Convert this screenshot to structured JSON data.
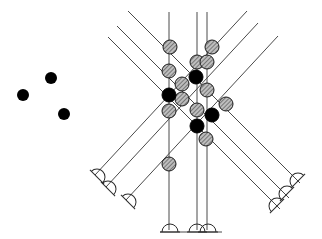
{
  "figure": {
    "canvas": {
      "width": 322,
      "height": 239,
      "background": "#ffffff"
    },
    "colors": {
      "line": "#4a4a4a",
      "node_filled": "#000000",
      "node_hatched_fill": "#b4b4b4",
      "node_stroke": "#1a1a1a",
      "support_stroke": "#2b2b2b",
      "legend_dot": "#000000"
    },
    "line_width": 1
  },
  "legend": {
    "name": "free-node-legend",
    "dots": [
      {
        "label": "node-a",
        "cx": 51,
        "cy": 78,
        "r": 6
      },
      {
        "label": "node-b",
        "cx": 23,
        "cy": 95,
        "r": 6
      },
      {
        "label": "node-c",
        "cx": 64,
        "cy": 114,
        "r": 6
      }
    ]
  },
  "structure": {
    "vertical_members": [
      {
        "name": "vertical-member-left",
        "x1": 169,
        "y1": 12,
        "x2": 169,
        "y2": 230
      },
      {
        "name": "vertical-member-center",
        "x1": 197,
        "y1": 12,
        "x2": 197,
        "y2": 230
      },
      {
        "name": "vertical-member-right",
        "x1": 207,
        "y1": 12,
        "x2": 207,
        "y2": 230
      }
    ],
    "diagonal_members_down_right": [
      {
        "name": "diagonal-dr-1",
        "x1": 128,
        "y1": 11,
        "x2": 300,
        "y2": 183
      },
      {
        "name": "diagonal-dr-2",
        "x1": 117,
        "y1": 26,
        "x2": 289,
        "y2": 198
      },
      {
        "name": "diagonal-dr-3",
        "x1": 108,
        "y1": 37,
        "x2": 280,
        "y2": 209
      }
    ],
    "diagonal_members_down_left": [
      {
        "name": "diagonal-dl-1",
        "x1": 247,
        "y1": 11,
        "x2": 95,
        "y2": 175
      },
      {
        "name": "diagonal-dl-2",
        "x1": 258,
        "y1": 23,
        "x2": 106,
        "y2": 187
      },
      {
        "name": "diagonal-dl-3",
        "x1": 278,
        "y1": 36,
        "x2": 126,
        "y2": 200
      }
    ],
    "base_line": {
      "name": "ground-base-line",
      "x1": 160,
      "y1": 232,
      "x2": 222,
      "y2": 232
    }
  },
  "supports": {
    "base_supports": [
      {
        "name": "support-base-left",
        "cx": 170,
        "cy": 232,
        "r": 8,
        "angle": 0
      },
      {
        "name": "support-base-center",
        "cx": 197,
        "cy": 232,
        "r": 8,
        "angle": 0
      },
      {
        "name": "support-base-right",
        "cx": 208,
        "cy": 232,
        "r": 8,
        "angle": 0
      }
    ],
    "left_supports": [
      {
        "name": "support-left-1",
        "cx": 97,
        "cy": 177,
        "r": 8,
        "angle": 45
      },
      {
        "name": "support-left-2",
        "cx": 108,
        "cy": 189,
        "r": 8,
        "angle": 45
      },
      {
        "name": "support-left-3",
        "cx": 128,
        "cy": 202,
        "r": 8,
        "angle": 45
      }
    ],
    "right_supports": [
      {
        "name": "support-right-1",
        "cx": 298,
        "cy": 181,
        "r": 8,
        "angle": -45
      },
      {
        "name": "support-right-2",
        "cx": 287,
        "cy": 194,
        "r": 8,
        "angle": -45
      },
      {
        "name": "support-right-3",
        "cx": 277,
        "cy": 206,
        "r": 8,
        "angle": -45
      }
    ]
  },
  "nodes": {
    "filled": [
      {
        "name": "joint-filled-1",
        "cx": 196,
        "cy": 77,
        "r": 7
      },
      {
        "name": "joint-filled-2",
        "cx": 169,
        "cy": 95,
        "r": 7
      },
      {
        "name": "joint-filled-3",
        "cx": 212,
        "cy": 115,
        "r": 7
      },
      {
        "name": "joint-filled-4",
        "cx": 197,
        "cy": 126,
        "r": 7
      }
    ],
    "hatched": [
      {
        "name": "joint-hatched-1",
        "cx": 170,
        "cy": 47,
        "r": 7
      },
      {
        "name": "joint-hatched-2",
        "cx": 212,
        "cy": 47,
        "r": 7
      },
      {
        "name": "joint-hatched-3",
        "cx": 197,
        "cy": 62,
        "r": 7
      },
      {
        "name": "joint-hatched-4",
        "cx": 207,
        "cy": 62,
        "r": 7
      },
      {
        "name": "joint-hatched-5",
        "cx": 169,
        "cy": 71,
        "r": 7
      },
      {
        "name": "joint-hatched-6",
        "cx": 182,
        "cy": 84,
        "r": 7
      },
      {
        "name": "joint-hatched-7",
        "cx": 207,
        "cy": 90,
        "r": 7
      },
      {
        "name": "joint-hatched-8",
        "cx": 182,
        "cy": 99,
        "r": 7
      },
      {
        "name": "joint-hatched-9",
        "cx": 169,
        "cy": 111,
        "r": 7
      },
      {
        "name": "joint-hatched-10",
        "cx": 197,
        "cy": 110,
        "r": 7
      },
      {
        "name": "joint-hatched-11",
        "cx": 226,
        "cy": 104,
        "r": 7
      },
      {
        "name": "joint-hatched-12",
        "cx": 206,
        "cy": 139,
        "r": 7
      },
      {
        "name": "joint-hatched-13",
        "cx": 169,
        "cy": 164,
        "r": 7
      }
    ]
  }
}
